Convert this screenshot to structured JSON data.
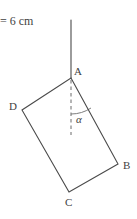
{
  "figure": {
    "title_text": "= 6 cm",
    "background_color": "#ffffff",
    "stroke_color": "#4a4a4a",
    "text_color": "#3f3f3f",
    "vertices": [
      {
        "name": "A",
        "label": "A",
        "x": 71,
        "y": 78,
        "label_x": 74,
        "label_y": 66
      },
      {
        "name": "B",
        "label": "B",
        "x": 118,
        "y": 164,
        "label_x": 123,
        "label_y": 160
      },
      {
        "name": "C",
        "label": "C",
        "x": 69,
        "y": 192,
        "label_x": 65,
        "label_y": 197
      },
      {
        "name": "D",
        "label": "D",
        "x": 22,
        "y": 110,
        "label_x": 9,
        "label_y": 101
      }
    ],
    "edges": [
      {
        "from": "A",
        "to": "B"
      },
      {
        "from": "B",
        "to": "C"
      },
      {
        "from": "C",
        "to": "D"
      },
      {
        "from": "D",
        "to": "A"
      }
    ],
    "vertical_line": {
      "name": "vertical-reference-line",
      "x": 71,
      "y_top": 20,
      "y_bottom": 78,
      "style": "solid"
    },
    "dashed_line": {
      "name": "vertical-dashed-extension",
      "x": 71,
      "y_top": 80,
      "y_bottom": 135,
      "style": "dashed"
    },
    "angle": {
      "label": "α",
      "symbol_name": "alpha",
      "label_x": 76,
      "label_y": 114,
      "arc_radius": 36,
      "vertex": "A"
    },
    "measure_label": {
      "text": "= 6 cm",
      "x": 0,
      "y": 15
    }
  }
}
